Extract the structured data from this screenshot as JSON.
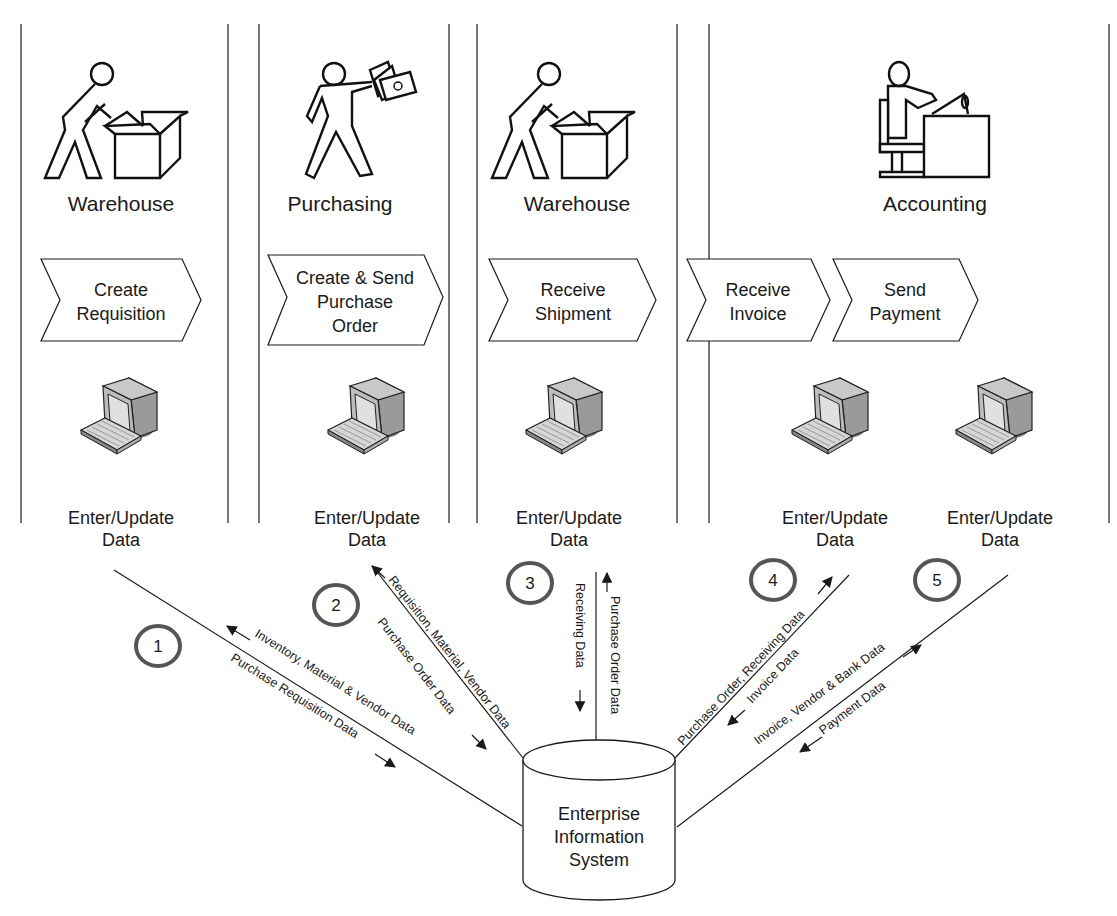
{
  "lanes": [
    {
      "title": "Warehouse",
      "step": [
        "Create",
        "Requisition"
      ],
      "pc_label": [
        "Enter/Update",
        "Data"
      ]
    },
    {
      "title": "Purchasing",
      "step": [
        "Create & Send",
        "Purchase",
        "Order"
      ],
      "pc_label": [
        "Enter/Update",
        "Data"
      ]
    },
    {
      "title": "Warehouse",
      "step": [
        "Receive",
        "Shipment"
      ],
      "pc_label": [
        "Enter/Update",
        "Data"
      ]
    },
    {
      "title": "Accounting",
      "steps": [
        {
          "step": [
            "Receive",
            "Invoice"
          ],
          "pc_label": [
            "Enter/Update",
            "Data"
          ]
        },
        {
          "step": [
            "Send",
            "Payment"
          ],
          "pc_label": [
            "Enter/Update",
            "Data"
          ]
        }
      ]
    }
  ],
  "flows": [
    {
      "number": "1",
      "to_system": "Purchase Requisition Data",
      "from_system": "Inventory, Material & Vendor Data"
    },
    {
      "number": "2",
      "to_system": "Purchase Order Data",
      "from_system": "Requisition, Material, Vendor Data"
    },
    {
      "number": "3",
      "to_system": "Receiving Data",
      "from_system": "Purchase Order Data"
    },
    {
      "number": "4",
      "to_system": "Invoice Data",
      "from_system": "Purchase Order, Receiving Data"
    },
    {
      "number": "5",
      "to_system": "Payment Data",
      "from_system": "Invoice, Vendor & Bank Data"
    }
  ],
  "database": {
    "label": [
      "Enterprise",
      "Information",
      "System"
    ]
  },
  "colors": {
    "line": "#1a1a1a",
    "circle": "#555555",
    "pc_body": "#bdbdbd",
    "pc_side": "#9a9a9a",
    "pc_screen": "#e0e0e0",
    "shadow": "#7a7a7a"
  }
}
